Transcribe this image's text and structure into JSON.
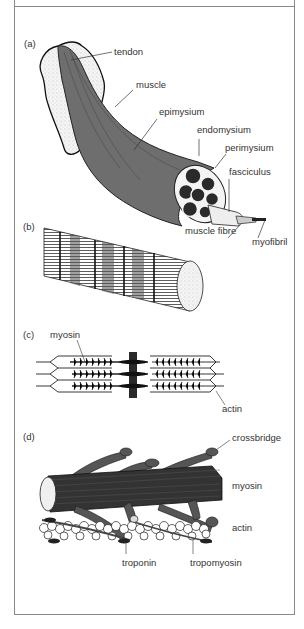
{
  "figure": {
    "colors": {
      "frame": "#8a8a8a",
      "muscle": "#6e6e6e",
      "dark": "#2a2a2a",
      "light": "#f2f2f2",
      "text": "#333333"
    }
  },
  "panels": [
    {
      "id": "a",
      "label": "(a)",
      "labels": [
        "tendon",
        "muscle",
        "epimysium",
        "endomysium",
        "perimysium",
        "fasciculus",
        "muscle fibre",
        "myofibril"
      ]
    },
    {
      "id": "b",
      "label": "(b)",
      "labels": []
    },
    {
      "id": "c",
      "label": "(c)",
      "labels": [
        "myosin",
        "actin"
      ]
    },
    {
      "id": "d",
      "label": "(d)",
      "labels": [
        "crossbridge",
        "myosin",
        "actin",
        "troponin",
        "tropomyosin"
      ]
    }
  ]
}
